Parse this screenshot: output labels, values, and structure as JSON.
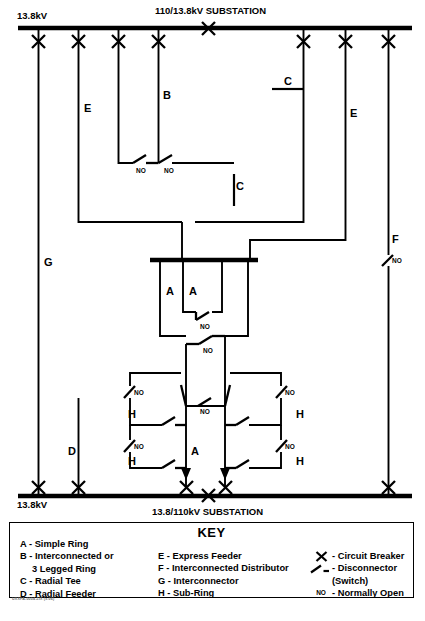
{
  "diagram": {
    "title_top": "110/13.8kV SUBSTATION",
    "title_bottom": "13.8/110kV SUBSTATION",
    "voltage_top_left": "13.8kV",
    "voltage_bottom_left": "13.8kV",
    "no_label": "NO",
    "feeder_labels": {
      "a1": "A",
      "a2": "A",
      "a3": "A",
      "b": "B",
      "c1": "C",
      "c2": "C",
      "d": "D",
      "e1": "E",
      "e2": "E",
      "f": "F",
      "g": "G",
      "h1": "H",
      "h2": "H",
      "h3": "H",
      "h4": "H"
    },
    "footer_code": "UXXFA-0004.ZIX (x.06)"
  },
  "key": {
    "title": "KEY",
    "column_a": [
      {
        "text": "A - Simple Ring",
        "indent": false
      },
      {
        "text": "B - Interconnected or",
        "indent": false
      },
      {
        "text": "3 Legged Ring",
        "indent": true
      },
      {
        "text": "C - Radial Tee",
        "indent": false
      },
      {
        "text": "D - Radial Feeder",
        "indent": false
      }
    ],
    "column_b": [
      {
        "text": "E - Express Feeder"
      },
      {
        "text": "F - Interconnected Distributor"
      },
      {
        "text": "G - Interconnector"
      },
      {
        "text": "H - Sub-Ring"
      }
    ],
    "column_c": [
      {
        "icon": "circuit-breaker-icon",
        "text": "- Circuit Breaker"
      },
      {
        "icon": "disconnector-icon",
        "text": "- Disconnector"
      },
      {
        "icon": "none",
        "text": "(Switch)"
      },
      {
        "icon": "normally-open-icon",
        "text": "- Normally Open"
      }
    ],
    "normally_open_symbol": "NO"
  },
  "colors": {
    "line": "#000000",
    "background": "#ffffff"
  }
}
